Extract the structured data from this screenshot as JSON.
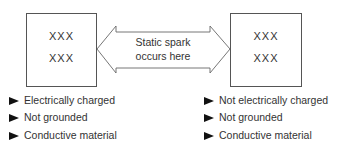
{
  "left_object": {
    "charges": [
      "XXX",
      "XXX"
    ],
    "properties": [
      "Electrically charged",
      "Not grounded",
      "Conductive material"
    ]
  },
  "right_object": {
    "charges": [
      "XXX",
      "XXX"
    ],
    "properties": [
      "Not electrically charged",
      "Not grounded",
      "Conductive material"
    ]
  },
  "arrow": {
    "label_line1": "Static spark",
    "label_line2": "occurs here",
    "type": "double-headed"
  },
  "icons": {
    "bullet": "right-pointing-triangle-icon"
  }
}
